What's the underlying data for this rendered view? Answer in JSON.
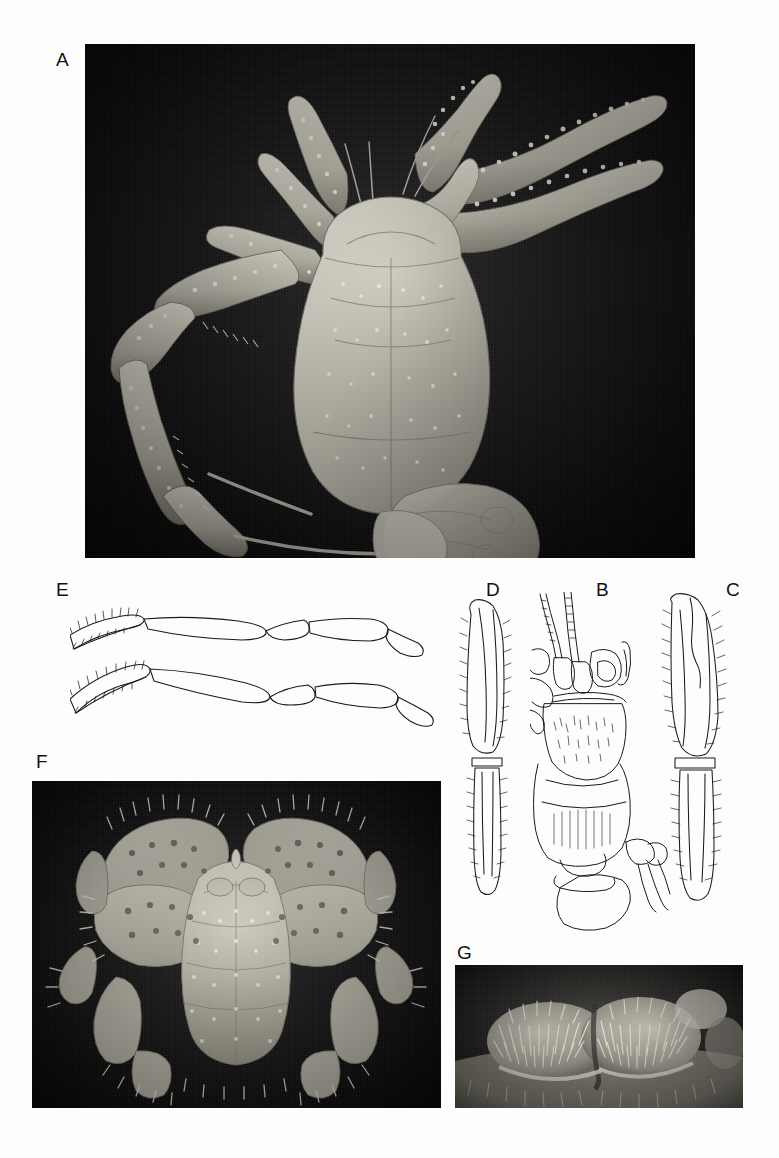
{
  "figure": {
    "background_color": "#fdfdfd",
    "width": 779,
    "height": 1158,
    "kind": "scientific-figure-plate"
  },
  "panels": [
    {
      "id": "A",
      "label": "A",
      "label_x": 56,
      "label_y": 50,
      "type": "photograph",
      "view": "whole animal, dorsal",
      "x": 85,
      "y": 44,
      "width": 610,
      "height": 514,
      "background_color": "#0c0c0c",
      "specimen_color": "#c9c6bc"
    },
    {
      "id": "E",
      "label": "E",
      "label_x": 56,
      "label_y": 580,
      "type": "line-drawing",
      "view": "paired appendages with setose distal articles",
      "x": 70,
      "y": 595,
      "width": 410,
      "height": 150,
      "stroke_color": "#1a1a1a"
    },
    {
      "id": "D",
      "label": "D",
      "label_x": 486,
      "label_y": 580,
      "type": "line-drawing",
      "view": "appendage, setose, elongate",
      "x": 455,
      "y": 592,
      "width": 78,
      "height": 330,
      "stroke_color": "#1a1a1a"
    },
    {
      "id": "B",
      "label": "B",
      "label_x": 596,
      "label_y": 580,
      "type": "line-drawing",
      "view": "cephalothorax with antennae and mouthparts",
      "x": 530,
      "y": 592,
      "width": 150,
      "height": 340,
      "stroke_color": "#1a1a1a"
    },
    {
      "id": "C",
      "label": "C",
      "label_x": 726,
      "label_y": 580,
      "type": "line-drawing",
      "view": "chela / cheliped, setose",
      "x": 650,
      "y": 592,
      "width": 90,
      "height": 330,
      "stroke_color": "#1a1a1a"
    },
    {
      "id": "F",
      "label": "F",
      "label_x": 36,
      "label_y": 752,
      "type": "photograph",
      "view": "carapace and chelipeds, dorsal close-up",
      "x": 32,
      "y": 781,
      "width": 409,
      "height": 327,
      "background_color": "#0d0d0d",
      "specimen_color": "#cfcbbf"
    },
    {
      "id": "G",
      "label": "G",
      "label_x": 457,
      "label_y": 943,
      "type": "photograph",
      "view": "ocular peduncles / eyes, close-up with setae",
      "x": 455,
      "y": 965,
      "width": 288,
      "height": 143,
      "background_color": "#121212",
      "specimen_color": "#b9b5aa"
    }
  ]
}
